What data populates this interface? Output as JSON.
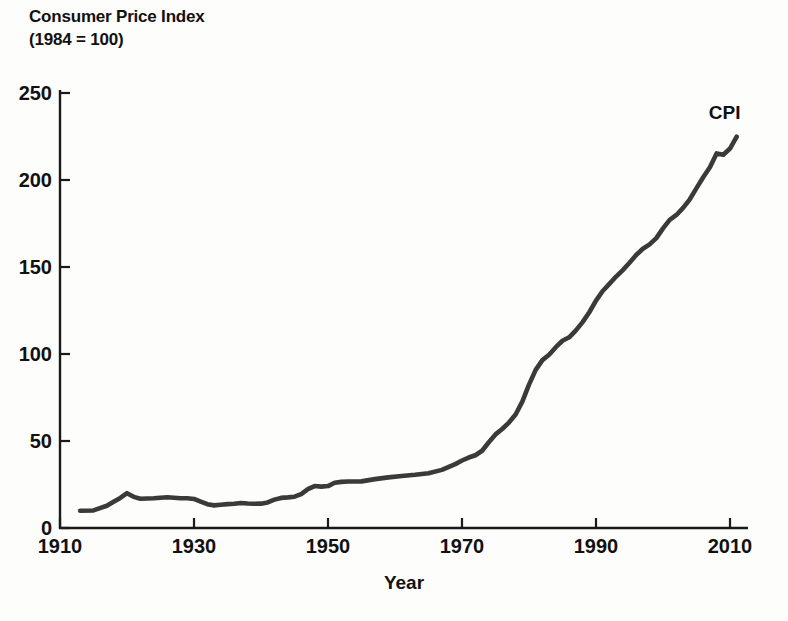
{
  "chart_data": {
    "type": "line",
    "title": "Consumer Price Index",
    "subtitle": "(1984 = 100)",
    "xlabel": "Year",
    "ylabel": "",
    "xlim": [
      1910,
      2013
    ],
    "ylim": [
      0,
      250
    ],
    "grid": false,
    "legend_position": "inline-right-end",
    "xticks": [
      1910,
      1930,
      1950,
      1970,
      1990,
      2010
    ],
    "xtick_labels": [
      "1910",
      "1930",
      "1950",
      "1970",
      "1990",
      "2010"
    ],
    "yticks": [
      0,
      50,
      100,
      150,
      200,
      250
    ],
    "ytick_labels": [
      "0",
      "50",
      "100",
      "150",
      "200",
      "250"
    ],
    "series": [
      {
        "name": "CPI",
        "label": "CPI",
        "color": "#3a3a3a",
        "x": [
          1913,
          1915,
          1917,
          1918,
          1919,
          1920,
          1921,
          1922,
          1924,
          1926,
          1928,
          1929,
          1930,
          1931,
          1932,
          1933,
          1934,
          1935,
          1936,
          1937,
          1938,
          1939,
          1940,
          1941,
          1942,
          1943,
          1944,
          1945,
          1946,
          1947,
          1948,
          1949,
          1950,
          1951,
          1952,
          1953,
          1955,
          1957,
          1959,
          1961,
          1963,
          1965,
          1967,
          1969,
          1970,
          1971,
          1972,
          1973,
          1974,
          1975,
          1976,
          1977,
          1978,
          1979,
          1980,
          1981,
          1982,
          1983,
          1984,
          1985,
          1986,
          1987,
          1988,
          1989,
          1990,
          1991,
          1992,
          1993,
          1994,
          1995,
          1996,
          1997,
          1998,
          1999,
          2000,
          2001,
          2002,
          2003,
          2004,
          2005,
          2006,
          2007,
          2008,
          2009,
          2010,
          2011
        ],
        "y": [
          9.9,
          10.1,
          12.8,
          15.1,
          17.3,
          20.0,
          17.9,
          16.8,
          17.1,
          17.7,
          17.1,
          17.1,
          16.7,
          15.2,
          13.7,
          13.0,
          13.4,
          13.7,
          13.9,
          14.4,
          14.1,
          13.9,
          14.0,
          14.7,
          16.3,
          17.3,
          17.6,
          18.0,
          19.5,
          22.3,
          24.1,
          23.8,
          24.1,
          26.0,
          26.5,
          26.7,
          26.8,
          28.1,
          29.1,
          29.9,
          30.6,
          31.5,
          33.4,
          36.7,
          38.8,
          40.5,
          41.8,
          44.4,
          49.3,
          53.8,
          56.9,
          60.6,
          65.2,
          72.6,
          82.4,
          90.9,
          96.5,
          99.6,
          103.9,
          107.6,
          109.6,
          113.6,
          118.3,
          124.0,
          130.7,
          136.2,
          140.3,
          144.5,
          148.2,
          152.4,
          156.9,
          160.5,
          163.0,
          166.6,
          172.2,
          177.1,
          179.9,
          184.0,
          188.9,
          195.3,
          201.6,
          207.3,
          215.3,
          214.5,
          218.1,
          224.9
        ]
      }
    ]
  }
}
